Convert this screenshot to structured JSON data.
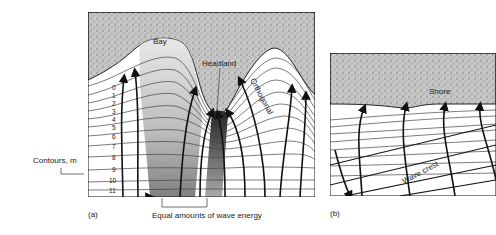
{
  "panel_a": {
    "caption": "(a)",
    "labels": {
      "bay": "Bay",
      "headland": "Headland",
      "orthogonal": "Orthogonal",
      "contours": "Contours, m",
      "energy": "Equal amounts of wave energy"
    },
    "contour_numbers": [
      "0",
      "1",
      "2",
      "3",
      "4",
      "5",
      "6",
      "7",
      "8",
      "9",
      "10",
      "11"
    ]
  },
  "panel_b": {
    "caption": "(b)",
    "labels": {
      "shore": "Shore",
      "wave_crest": "Wave crest"
    }
  },
  "colors": {
    "land": "#b8b8b8",
    "ink": "#1a1a1a",
    "shade_dark": "#555555",
    "shade_light": "#c8c8c8"
  }
}
